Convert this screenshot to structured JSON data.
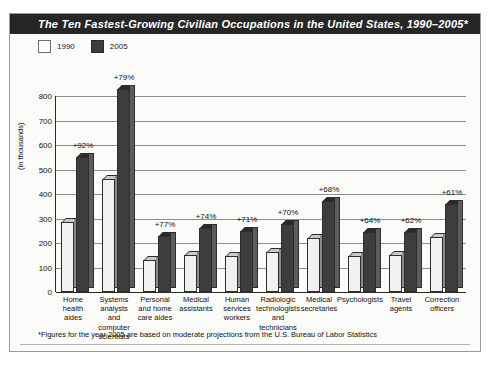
{
  "title": "The Ten Fastest-Growing Civilian Occupations in the United States, 1990–2005*",
  "legend": {
    "items": [
      {
        "label": "1990",
        "color": "#fdfdfd",
        "key": "1990"
      },
      {
        "label": "2005",
        "color": "#3c3c3c",
        "key": "2005"
      }
    ]
  },
  "footnote": "*Figures for the year 2005 are based on moderate projections from the U.S. Bureau of Labor Statistics",
  "colors": {
    "title_bar": "#262626",
    "card_bg": "#fbfbf9",
    "bar_1990": "#f1f1ef",
    "bar_2005": "#3d3d3d",
    "gridline": "#8e8e8e",
    "axis": "#2b2b2b"
  },
  "chart_data": {
    "type": "bar",
    "title": "The Ten Fastest-Growing Civilian Occupations in the United States, 1990–2005*",
    "xlabel": "",
    "ylabel": "(in thousands)",
    "ylim": [
      0,
      800
    ],
    "yticks": [
      0,
      100,
      200,
      300,
      400,
      500,
      600,
      700,
      800
    ],
    "ytick_labels": [
      "0",
      "100",
      "200",
      "300",
      "400",
      "500",
      "600",
      "700",
      "800"
    ],
    "grid": true,
    "legend_position": "top-left",
    "categories": [
      "Home\nhealth\naides",
      "Systems\nanalysts\nand\ncomputer\nscientists",
      "Personal\nand home\ncare aides",
      "Medical\nassistants",
      "Human\nservices\nworkers",
      "Radiologic\ntechnologists\nand\ntechnicians",
      "Medical\nsecretaries",
      "Psychologists",
      "Travel\nagents",
      "Correction\nofficers"
    ],
    "series": [
      {
        "name": "1990",
        "values": [
          287,
          463,
          130,
          150,
          145,
          162,
          222,
          148,
          150,
          224
        ]
      },
      {
        "name": "2005",
        "values": [
          550,
          829,
          230,
          261,
          249,
          276,
          373,
          243,
          243,
          361
        ]
      }
    ],
    "annotations": [
      "+92%",
      "+79%",
      "+77%",
      "+74%",
      "+71%",
      "+70%",
      "+68%",
      "+64%",
      "+62%",
      "+61%"
    ]
  }
}
